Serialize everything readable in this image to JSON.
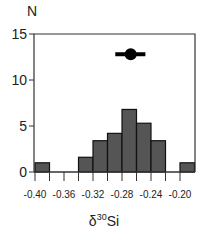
{
  "chart_data": {
    "type": "bar",
    "title": "",
    "xlabel": "δ30Si",
    "xlabel_parts": {
      "prefix": "δ",
      "sup": "30",
      "suffix": "Si"
    },
    "ylabel": "N",
    "xlim": [
      -0.4,
      -0.19
    ],
    "ylim": [
      0,
      15
    ],
    "x_ticks": [
      -0.4,
      -0.36,
      -0.32,
      -0.28,
      -0.24,
      -0.2
    ],
    "x_tick_labels": [
      "-0.40",
      "-0.36",
      "-0.32",
      "-0.28",
      "-0.24",
      "-0.20"
    ],
    "y_ticks": [
      0,
      5,
      10,
      15
    ],
    "y_tick_labels": [
      "0",
      "5",
      "10",
      "15"
    ],
    "grid": false,
    "bin_width": 0.02,
    "bins": [
      {
        "left": -0.4,
        "count": 1
      },
      {
        "left": -0.34,
        "count": 1.6
      },
      {
        "left": -0.32,
        "count": 3.4
      },
      {
        "left": -0.3,
        "count": 4.2
      },
      {
        "left": -0.28,
        "count": 6.8
      },
      {
        "left": -0.26,
        "count": 5.3
      },
      {
        "left": -0.24,
        "count": 3.4
      },
      {
        "left": -0.2,
        "count": 1
      }
    ],
    "mean_marker": {
      "x": -0.268,
      "error_low": -0.281,
      "error_high": -0.256,
      "y": 12.8
    },
    "bar_color": "#555555"
  }
}
